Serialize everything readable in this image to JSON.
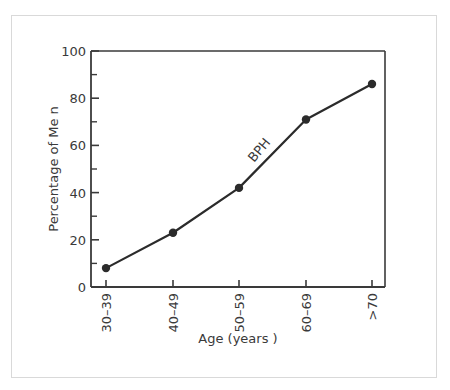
{
  "chart_data": {
    "type": "line",
    "title": "",
    "xlabel": "Age (years )",
    "ylabel": "Percentage of Me  n",
    "categories": [
      "30–39",
      "40–49",
      "50–59",
      "60–69",
      ">70"
    ],
    "series": [
      {
        "name": "BPH",
        "values": [
          8,
          23,
          42,
          71,
          86
        ]
      }
    ],
    "ylim": [
      0,
      100
    ],
    "yticks": [
      0,
      20,
      40,
      60,
      80,
      100
    ],
    "yminor_ticks": [
      10,
      30,
      50,
      70,
      90
    ],
    "grid": false,
    "legend": "none",
    "annotations": [
      {
        "text": "BPH",
        "near_category": "50–59 to 60–69",
        "rotation": -50
      }
    ],
    "colors": {
      "line": "#2b2b2b",
      "marker": "#2b2b2b",
      "axis": "#3a3a3a",
      "frame": "#d9d9d9"
    }
  }
}
